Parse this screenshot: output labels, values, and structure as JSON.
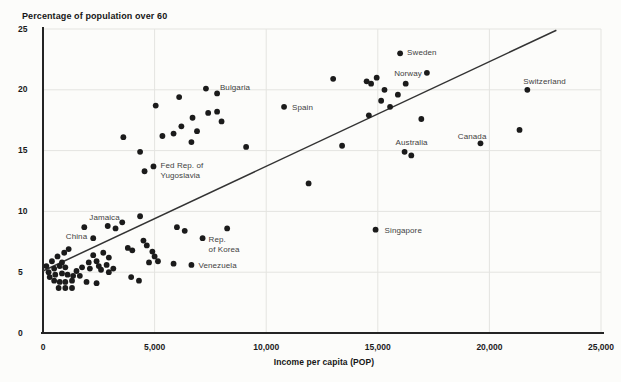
{
  "colors": {
    "background": "#fcfcfa",
    "dot": "#1b1b1b",
    "axis": "#242424",
    "grid": "#e4e4e0",
    "trend": "#333333",
    "tick_text": "#1a1a1a",
    "label_text": "#3f3f3f"
  },
  "chart_data": {
    "type": "scatter",
    "title": "Percentage of population over 60",
    "xlabel": "Income per capita (POP)",
    "ylabel": "Percentage of population over 60",
    "xlim": [
      0,
      25000
    ],
    "ylim": [
      0,
      25
    ],
    "grid": true,
    "x_ticks": [
      {
        "value": 0,
        "label": "0"
      },
      {
        "value": 5000,
        "label": "5,000"
      },
      {
        "value": 10000,
        "label": "10,000"
      },
      {
        "value": 15000,
        "label": "15,000"
      },
      {
        "value": 20000,
        "label": "20,000"
      },
      {
        "value": 25000,
        "label": "25,000"
      }
    ],
    "y_ticks": [
      {
        "value": 0,
        "label": "0"
      },
      {
        "value": 5,
        "label": "5"
      },
      {
        "value": 10,
        "label": "10"
      },
      {
        "value": 15,
        "label": "15"
      },
      {
        "value": 20,
        "label": "20"
      },
      {
        "value": 25,
        "label": "25"
      }
    ],
    "trend_line": {
      "x1": 0,
      "y1": 5.1,
      "x2": 23000,
      "y2": 24.9
    },
    "labeled_points": [
      {
        "label": "Sweden",
        "x": 16000,
        "y": 23.0,
        "align": "left",
        "dx": 7,
        "dy": -5
      },
      {
        "label": "Norway",
        "x": 17200,
        "y": 21.4,
        "align": "right",
        "dx": -5,
        "dy": -4
      },
      {
        "label": "Switzerland",
        "x": 21700,
        "y": 20.0,
        "align": "left",
        "dx": -4,
        "dy": -13
      },
      {
        "label": "Bulgaria",
        "x": 7300,
        "y": 20.1,
        "align": "left",
        "dx": 14,
        "dy": -6
      },
      {
        "label": "Spain",
        "x": 10800,
        "y": 18.6,
        "align": "left",
        "dx": 8,
        "dy": -4
      },
      {
        "label": "Canada",
        "x": 19600,
        "y": 15.6,
        "align": "right",
        "dx": 6,
        "dy": -11
      },
      {
        "label": "Australia",
        "x": 16200,
        "y": 14.9,
        "align": "left",
        "dx": -9,
        "dy": -14
      },
      {
        "label": "Fed Rep. of\nYugoslavia",
        "x": 4950,
        "y": 13.7,
        "align": "left",
        "dx": 7,
        "dy": -5
      },
      {
        "label": "Singapore",
        "x": 14900,
        "y": 8.5,
        "align": "left",
        "dx": 9,
        "dy": -4
      },
      {
        "label": "Jamaica",
        "x": 1850,
        "y": 8.7,
        "align": "left",
        "dx": 5,
        "dy": -14
      },
      {
        "label": "China",
        "x": 2250,
        "y": 7.8,
        "align": "right",
        "dx": -6,
        "dy": -6
      },
      {
        "label": "Rep.\nof Korea",
        "x": 7150,
        "y": 7.8,
        "align": "left",
        "dx": 6,
        "dy": -3
      },
      {
        "label": "Venezuela",
        "x": 6650,
        "y": 5.6,
        "align": "left",
        "dx": 7,
        "dy": -4
      }
    ],
    "points": [
      [
        7800,
        19.7
      ],
      [
        6100,
        19.4
      ],
      [
        5050,
        18.7
      ],
      [
        7400,
        18.1
      ],
      [
        7800,
        18.2
      ],
      [
        8000,
        17.4
      ],
      [
        6700,
        17.7
      ],
      [
        6200,
        17.0
      ],
      [
        6900,
        16.6
      ],
      [
        5850,
        16.4
      ],
      [
        5350,
        16.2
      ],
      [
        6650,
        15.7
      ],
      [
        3600,
        16.1
      ],
      [
        4350,
        14.9
      ],
      [
        4550,
        13.3
      ],
      [
        9100,
        15.3
      ],
      [
        13000,
        20.9
      ],
      [
        14500,
        20.7
      ],
      [
        14700,
        20.5
      ],
      [
        14950,
        21.0
      ],
      [
        15300,
        20.0
      ],
      [
        16250,
        20.5
      ],
      [
        15900,
        19.6
      ],
      [
        15150,
        19.1
      ],
      [
        15550,
        18.6
      ],
      [
        14600,
        17.9
      ],
      [
        16950,
        17.6
      ],
      [
        13400,
        15.4
      ],
      [
        16500,
        14.6
      ],
      [
        21350,
        16.7
      ],
      [
        11900,
        12.3
      ],
      [
        6000,
        8.7
      ],
      [
        6350,
        8.4
      ],
      [
        8250,
        8.6
      ],
      [
        4350,
        9.6
      ],
      [
        3550,
        9.1
      ],
      [
        2900,
        8.8
      ],
      [
        3250,
        8.6
      ],
      [
        3800,
        7.0
      ],
      [
        4000,
        6.8
      ],
      [
        4500,
        7.6
      ],
      [
        4650,
        7.2
      ],
      [
        4900,
        6.7
      ],
      [
        5000,
        6.3
      ],
      [
        5150,
        5.9
      ],
      [
        5850,
        5.7
      ],
      [
        4750,
        5.8
      ],
      [
        3950,
        4.6
      ],
      [
        4300,
        4.3
      ],
      [
        2700,
        6.6
      ],
      [
        2950,
        6.2
      ],
      [
        2250,
        6.4
      ],
      [
        2400,
        5.9
      ],
      [
        2850,
        5.6
      ],
      [
        3150,
        5.3
      ],
      [
        2050,
        5.8
      ],
      [
        1750,
        5.4
      ],
      [
        2100,
        5.3
      ],
      [
        2500,
        5.5
      ],
      [
        2600,
        5.2
      ],
      [
        2950,
        5.0
      ],
      [
        1950,
        4.2
      ],
      [
        2400,
        4.1
      ],
      [
        1500,
        5.1
      ],
      [
        1650,
        4.7
      ],
      [
        400,
        5.9
      ],
      [
        650,
        6.3
      ],
      [
        950,
        6.6
      ],
      [
        1150,
        6.9
      ],
      [
        150,
        5.5
      ],
      [
        500,
        5.3
      ],
      [
        750,
        5.5
      ],
      [
        1000,
        5.4
      ],
      [
        850,
        5.8
      ],
      [
        550,
        4.8
      ],
      [
        850,
        4.9
      ],
      [
        1100,
        4.8
      ],
      [
        1350,
        4.7
      ],
      [
        500,
        4.3
      ],
      [
        750,
        4.2
      ],
      [
        1000,
        4.2
      ],
      [
        1300,
        4.3
      ],
      [
        700,
        3.7
      ],
      [
        1000,
        3.7
      ],
      [
        1300,
        3.7
      ],
      [
        300,
        4.6
      ],
      [
        250,
        5.0
      ]
    ]
  }
}
